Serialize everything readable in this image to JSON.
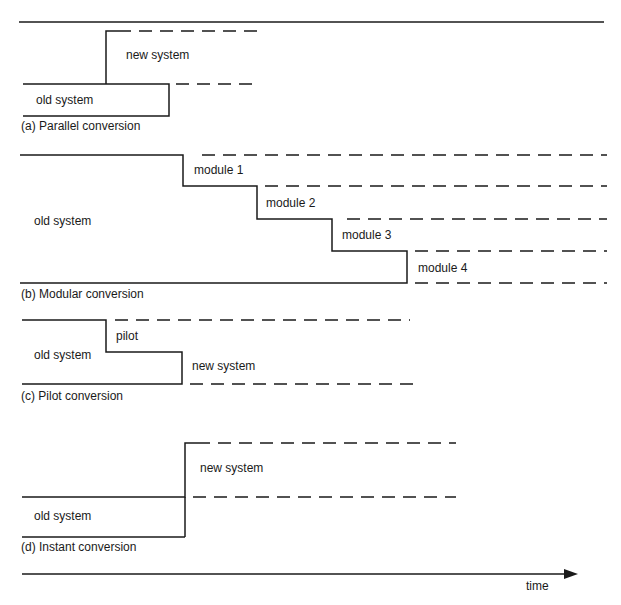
{
  "diagram": {
    "panels": {
      "a": {
        "caption": "(a) Parallel conversion",
        "old": "old system",
        "new": "new system"
      },
      "b": {
        "caption": "(b) Modular conversion",
        "old": "old system",
        "modules": [
          "module 1",
          "module 2",
          "module 3",
          "module 4"
        ]
      },
      "c": {
        "caption": "(c) Pilot conversion",
        "old": "old system",
        "pilot": "pilot",
        "new": "new system"
      },
      "d": {
        "caption": "(d) Instant conversion",
        "old": "old system",
        "new": "new system"
      }
    },
    "axis": {
      "label": "time"
    },
    "colors": {
      "line": "#1a1a1a",
      "background": "#ffffff"
    }
  }
}
